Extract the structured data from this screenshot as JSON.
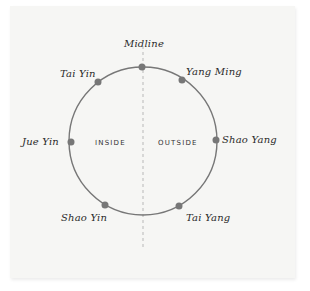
{
  "diagram": {
    "type": "circle-channel-map",
    "colors": {
      "background": "#f6f6f4",
      "circle": "#777777",
      "dot": "#777777",
      "midline": "#aaaaaa",
      "text": "#2a2a2a"
    },
    "top_label": "Midline",
    "regions": {
      "left": "INSIDE",
      "right": "OUTSIDE"
    },
    "points": [
      {
        "name": "Midline",
        "position": "top"
      },
      {
        "name": "Yang Ming",
        "position": "upper-right"
      },
      {
        "name": "Shao Yang",
        "position": "right"
      },
      {
        "name": "Tai Yang",
        "position": "lower-right"
      },
      {
        "name": "Shao Yin",
        "position": "lower-left"
      },
      {
        "name": "Jue Yin",
        "position": "left"
      },
      {
        "name": "Tai Yin",
        "position": "upper-left"
      }
    ]
  }
}
